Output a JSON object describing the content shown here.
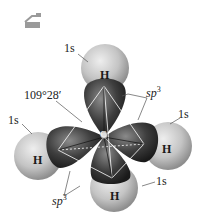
{
  "diagram": {
    "icon": "tray-icon",
    "angle_label": "109°28′",
    "center_atom": "C",
    "hydrogens": [
      {
        "id": "top",
        "atom": "H",
        "orbital": "1s"
      },
      {
        "id": "left",
        "atom": "H",
        "orbital": "1s"
      },
      {
        "id": "right",
        "atom": "H",
        "orbital": "1s"
      },
      {
        "id": "bottom",
        "atom": "H",
        "orbital": "1s"
      }
    ],
    "hybrid_labels": [
      {
        "id": "upper-right",
        "prefix": "sp",
        "sup": "3"
      },
      {
        "id": "lower-left",
        "prefix": "sp",
        "sup": "3"
      }
    ],
    "colors": {
      "h_sphere": "#c8c8c8",
      "sp3_lobe": "#4a4a4a",
      "lines": "#ffffff",
      "text": "#222222"
    }
  }
}
